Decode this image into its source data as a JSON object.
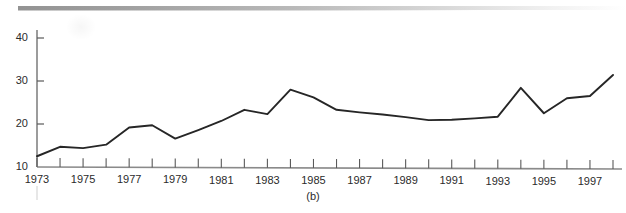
{
  "figure": {
    "caption": "(b)",
    "colors": {
      "line": "#262626",
      "axis": "#555555",
      "text": "#2b2b2b",
      "background": "#ffffff"
    }
  },
  "chart_data": {
    "type": "line",
    "title": "",
    "subtitle": "",
    "xlabel": "",
    "ylabel": "",
    "xlim": [
      1973,
      1998
    ],
    "ylim": [
      10,
      42
    ],
    "yticks": [
      10,
      20,
      30,
      40
    ],
    "ytick_labels": [
      "10",
      "20",
      "30",
      "40"
    ],
    "xticks": [
      1973,
      1974,
      1975,
      1976,
      1977,
      1978,
      1979,
      1980,
      1981,
      1982,
      1983,
      1984,
      1985,
      1986,
      1987,
      1988,
      1989,
      1990,
      1991,
      1992,
      1993,
      1994,
      1995,
      1996,
      1997,
      1998
    ],
    "xtick_labels": [
      "1973",
      "",
      "1975",
      "",
      "1977",
      "",
      "1979",
      "",
      "1981",
      "",
      "1983",
      "",
      "1985",
      "",
      "1987",
      "",
      "1989",
      "",
      "1991",
      "",
      "1993",
      "",
      "1995",
      "",
      "1997",
      ""
    ],
    "visible_xtick_labels": [
      "1973",
      "1975",
      "1977",
      "1979",
      "1981",
      "1983",
      "1985",
      "1987",
      "1989",
      "1991",
      "1993",
      "1995",
      "1997"
    ],
    "grid": false,
    "legend": false,
    "legend_position": "none",
    "x": [
      1973,
      1974,
      1975,
      1976,
      1977,
      1978,
      1979,
      1980,
      1981,
      1982,
      1983,
      1984,
      1985,
      1986,
      1987,
      1988,
      1989,
      1990,
      1991,
      1992,
      1993,
      1994,
      1995,
      1996,
      1997,
      1998
    ],
    "values": [
      12.5,
      14.7,
      14.4,
      15.2,
      19.2,
      19.7,
      16.6,
      18.6,
      20.7,
      23.3,
      22.3,
      28.0,
      26.2,
      23.3,
      22.7,
      22.2,
      21.6,
      20.9,
      21.0,
      21.3,
      21.7,
      28.4,
      22.5,
      26.0,
      26.5,
      31.4
    ],
    "series": [
      {
        "name": "series-1",
        "values": [
          12.5,
          14.7,
          14.4,
          15.2,
          19.2,
          19.7,
          16.6,
          18.6,
          20.7,
          23.3,
          22.3,
          28.0,
          26.2,
          23.3,
          22.7,
          22.2,
          21.6,
          20.9,
          21.0,
          21.3,
          21.7,
          28.4,
          22.5,
          26.0,
          26.5,
          31.4
        ]
      }
    ]
  }
}
